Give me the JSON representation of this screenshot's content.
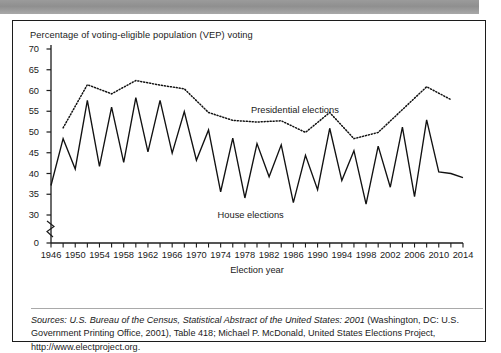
{
  "figure": {
    "title": "Percentage of voting-eligible population (VEP) voting",
    "xlabel": "Election year",
    "presidential_label": "Presidential elections",
    "house_label": "House elections",
    "source_prefix": "Sources:",
    "source_italic": " U.S. Bureau of the Census, Statistical Abstract of the United States: 2001",
    "source_rest": " (Washington, DC: U.S. Government Printing Office, 2001), Table 418; Michael P. McDonald, United States Elections Project, http://www.electproject.org."
  },
  "chart_data": {
    "type": "line",
    "title": "Percentage of voting-eligible population (VEP) voting",
    "xlabel": "Election year",
    "ylabel": "Percentage of voting-eligible population (VEP) voting",
    "xlim": [
      1946,
      2014
    ],
    "ylim": [
      28,
      70
    ],
    "y_axis_break": true,
    "y_ticks": [
      0,
      30,
      35,
      40,
      45,
      50,
      55,
      60,
      65,
      70
    ],
    "x_ticks": [
      1946,
      1948,
      1950,
      1952,
      1954,
      1956,
      1958,
      1960,
      1962,
      1964,
      1966,
      1968,
      1970,
      1972,
      1974,
      1976,
      1978,
      1980,
      1982,
      1984,
      1986,
      1988,
      1990,
      1992,
      1994,
      1996,
      1998,
      2000,
      2002,
      2004,
      2006,
      2008,
      2010,
      2012,
      2014
    ],
    "x_tick_labels": [
      1946,
      1950,
      1954,
      1958,
      1962,
      1966,
      1970,
      1974,
      1978,
      1982,
      1986,
      1990,
      1994,
      1998,
      2002,
      2006,
      2010,
      2014
    ],
    "grid": false,
    "legend_position": "inline-annotation",
    "series": [
      {
        "name": "House elections",
        "style": "solid",
        "x": [
          1946,
          1948,
          1950,
          1952,
          1954,
          1956,
          1958,
          1960,
          1962,
          1964,
          1966,
          1968,
          1970,
          1972,
          1974,
          1976,
          1978,
          1980,
          1982,
          1984,
          1986,
          1988,
          1990,
          1992,
          1994,
          1996,
          1998,
          2000,
          2002,
          2004,
          2006,
          2008,
          2010,
          2012,
          2014
        ],
        "values": [
          37.1,
          48.4,
          41.1,
          57.6,
          41.7,
          56.0,
          42.7,
          58.3,
          45.2,
          57.6,
          44.9,
          54.9,
          43.2,
          50.5,
          35.6,
          48.5,
          34.1,
          47.2,
          39.2,
          46.9,
          33.0,
          44.4,
          36.1,
          50.9,
          38.3,
          45.5,
          32.6,
          46.6,
          36.7,
          51.2,
          34.4,
          52.9,
          40.4,
          40.0,
          39.0
        ]
      },
      {
        "name": "Presidential elections",
        "style": "dotted",
        "x": [
          1948,
          1952,
          1956,
          1960,
          1964,
          1968,
          1972,
          1976,
          1980,
          1984,
          1988,
          1992,
          1996,
          2000,
          2004,
          2008,
          2012
        ],
        "values": [
          51.0,
          61.4,
          59.2,
          62.4,
          61.3,
          60.4,
          54.7,
          52.8,
          52.4,
          52.7,
          49.9,
          54.7,
          48.4,
          49.9,
          55.4,
          60.9,
          57.8
        ]
      }
    ]
  }
}
